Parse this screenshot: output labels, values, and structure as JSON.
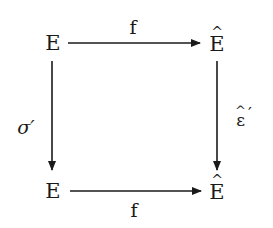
{
  "diagram": {
    "type": "commutative-square",
    "nodes": {
      "top_left": {
        "label": "E"
      },
      "top_right": {
        "label": "E",
        "accent": "^",
        "full": "Ê"
      },
      "bottom_left": {
        "label": "E"
      },
      "bottom_right": {
        "label": "E",
        "accent": "^",
        "full": "Ê"
      }
    },
    "arrows": {
      "top": {
        "from": "top_left",
        "to": "top_right",
        "label": "f"
      },
      "bottom": {
        "from": "bottom_left",
        "to": "bottom_right",
        "label": "f"
      },
      "left": {
        "from": "top_left",
        "to": "bottom_left",
        "label": "σ′"
      },
      "right": {
        "from": "top_right",
        "to": "bottom_right",
        "label_base": "ε",
        "label_accent": "^",
        "label_prime": "′",
        "full": "ε̂′"
      }
    },
    "colors": {
      "ink": "#1a1a1a",
      "background": "#ffffff"
    }
  }
}
